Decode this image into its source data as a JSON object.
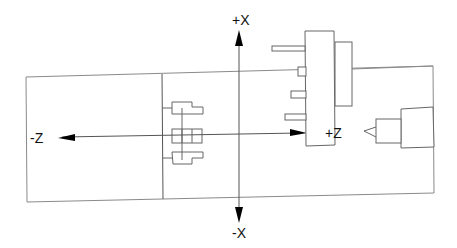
{
  "diagram": {
    "labels": {
      "plus_x": "+X",
      "minus_x": "-X",
      "plus_z": "+Z",
      "minus_z": "-Z"
    },
    "components": [
      "workpiece/bed frame",
      "chuck jaws",
      "tool turret",
      "tailstock with center"
    ],
    "colors": {
      "line": "#555555",
      "frame": "#8a8a8a",
      "arrow": "#000000",
      "background": "#ffffff"
    }
  }
}
